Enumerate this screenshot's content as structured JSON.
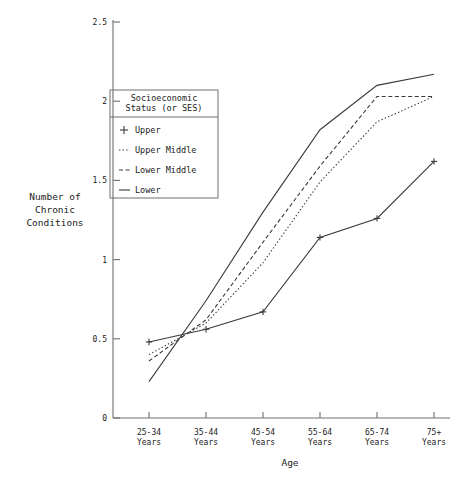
{
  "chart_data": {
    "type": "line",
    "title": "",
    "xlabel": "Age",
    "ylabel": "Number of Chronic Conditions",
    "ylabel_lines": [
      "Number of",
      "Chronic",
      "Conditions"
    ],
    "categories": [
      "25-34 Years",
      "35-44 Years",
      "45-54 Years",
      "55-64 Years",
      "65-74 Years",
      "75+ Years"
    ],
    "category_lines": [
      [
        "25-34",
        "Years"
      ],
      [
        "35-44",
        "Years"
      ],
      [
        "45-54",
        "Years"
      ],
      [
        "55-64",
        "Years"
      ],
      [
        "65-74",
        "Years"
      ],
      [
        "75+",
        "Years"
      ]
    ],
    "ylim": [
      0,
      2.5
    ],
    "yticks": [
      0,
      0.5,
      1,
      1.5,
      2,
      2.5
    ],
    "ytick_labels": [
      "0",
      "0.5",
      "1",
      "1.5",
      "2",
      "2.5"
    ],
    "grid": false,
    "legend_position": "upper-left-inside",
    "legend_title_lines": [
      "Socioeconomic",
      "Status (or SES)"
    ],
    "series": [
      {
        "name": "Upper",
        "marker": "plus",
        "style": "plus-marker",
        "values": [
          0.48,
          0.56,
          0.67,
          1.14,
          1.26,
          1.62
        ]
      },
      {
        "name": "Upper Middle",
        "marker": "none",
        "style": "dotted",
        "values": [
          0.4,
          0.6,
          0.98,
          1.49,
          1.87,
          2.03
        ]
      },
      {
        "name": "Lower Middle",
        "marker": "none",
        "style": "dashed",
        "values": [
          0.36,
          0.62,
          1.11,
          1.59,
          2.03,
          2.03
        ]
      },
      {
        "name": "Lower",
        "marker": "none",
        "style": "solid",
        "values": [
          0.23,
          0.74,
          1.3,
          1.82,
          2.1,
          2.17
        ]
      }
    ]
  },
  "axes": {
    "y_title_lines": [
      "Number of",
      "Chronic",
      "Conditions"
    ],
    "x_title": "Age"
  },
  "legend": {
    "title_line1": "Socioeconomic",
    "title_line2": "Status (or SES)",
    "entries": [
      {
        "label": "Upper",
        "glyph": "plus-glyph"
      },
      {
        "label": "Upper Middle",
        "glyph": "dotted-glyph"
      },
      {
        "label": "Lower Middle",
        "glyph": "dashed-glyph"
      },
      {
        "label": "Lower",
        "glyph": "solid-glyph"
      }
    ]
  },
  "colors": {
    "axis": "#6f6f6f",
    "series": "#3a3a3a",
    "text": "#1a1a1a",
    "background": "#ffffff"
  }
}
